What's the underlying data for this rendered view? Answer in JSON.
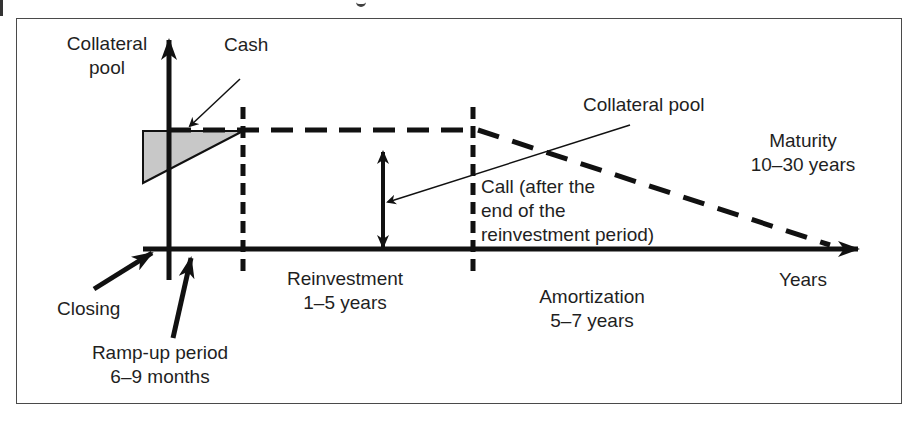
{
  "diagram": {
    "type": "timeline",
    "axes": {
      "y_label_line1": "Collateral",
      "y_label_line2": "pool",
      "x_label": "Years"
    },
    "annotations": {
      "cash": "Cash",
      "collateral_pool": "Collateral pool",
      "call_line1": "Call (after the",
      "call_line2": "end of the",
      "call_line3": "reinvestment period)",
      "maturity_line1": "Maturity",
      "maturity_line2": "10–30 years",
      "closing": "Closing",
      "ramp_up_line1": "Ramp-up period",
      "ramp_up_line2": "6–9 months",
      "reinvestment_line1": "Reinvestment",
      "reinvestment_line2": "1–5 years",
      "amortization_line1": "Amortization",
      "amortization_line2": "5–7 years"
    },
    "phases": [
      {
        "name": "Ramp-up period",
        "duration": "6–9 months"
      },
      {
        "name": "Reinvestment",
        "duration": "1–5 years"
      },
      {
        "name": "Amortization",
        "duration": "5–7 years"
      },
      {
        "name": "Maturity",
        "duration": "10–30 years"
      }
    ],
    "colors": {
      "line": "#111111",
      "cash_fill": "#c8c8c8",
      "frame": "#4a4a4a"
    }
  }
}
